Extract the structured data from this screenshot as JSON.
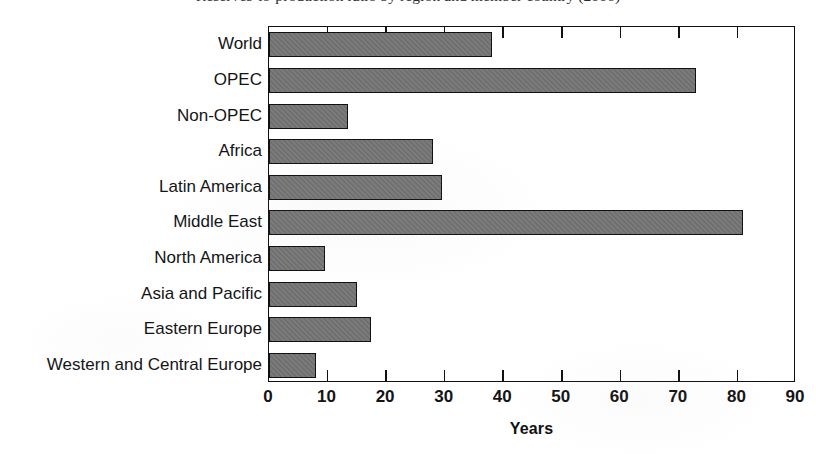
{
  "title": {
    "text": "Reserves-to-production ratio by region and member country (2006)",
    "visible_fragment": "clipped at top edge of image"
  },
  "chart_data": {
    "type": "bar",
    "orientation": "horizontal",
    "title": "Reserves-to-production ratio by region and member country (2006)",
    "xlabel": "Years",
    "ylabel": "",
    "categories": [
      "World",
      "OPEC",
      "Non-OPEC",
      "Africa",
      "Latin America",
      "Middle East",
      "North America",
      "Asia and Pacific",
      "Eastern Europe",
      "Western and Central Europe"
    ],
    "values": [
      38,
      73,
      13.5,
      28,
      29.5,
      81,
      9.5,
      15,
      17.5,
      8
    ],
    "xlim": [
      0,
      90
    ],
    "xticks": [
      0,
      10,
      20,
      30,
      40,
      50,
      60,
      70,
      80,
      90
    ],
    "xtick_labels": [
      "0",
      "10",
      "20",
      "30",
      "40",
      "50",
      "60",
      "70",
      "80",
      "90"
    ],
    "grid": false,
    "legend": null,
    "bar_color": "#737373",
    "bar_edge_color": "#111111",
    "frame_color": "#111111",
    "background": "#ffffff"
  },
  "axis": {
    "x_title": "Years"
  }
}
